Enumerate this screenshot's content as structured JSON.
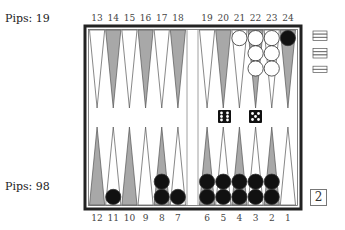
{
  "players": {
    "top": {
      "pips_label": "Pips:",
      "pips": "19",
      "color": "white"
    },
    "bottom": {
      "pips_label": "Pips:",
      "pips": "98",
      "color": "black"
    }
  },
  "point_labels_top": [
    "13",
    "14",
    "15",
    "16",
    "17",
    "18",
    "19",
    "20",
    "21",
    "22",
    "23",
    "24"
  ],
  "point_labels_bottom": [
    "12",
    "11",
    "10",
    "9",
    "8",
    "7",
    "6",
    "5",
    "4",
    "3",
    "2",
    "1"
  ],
  "checkers": {
    "21": {
      "color": "white",
      "count": 1
    },
    "22": {
      "color": "white",
      "count": 3
    },
    "23": {
      "color": "white",
      "count": 3
    },
    "24": {
      "color": "black",
      "count": 1
    },
    "11": {
      "color": "black",
      "count": 1
    },
    "8": {
      "color": "black",
      "count": 2
    },
    "7": {
      "color": "black",
      "count": 1
    },
    "6": {
      "color": "black",
      "count": 2
    },
    "5": {
      "color": "black",
      "count": 2
    },
    "4": {
      "color": "black",
      "count": 2
    },
    "3": {
      "color": "black",
      "count": 2
    },
    "2": {
      "color": "black",
      "count": 2
    }
  },
  "borne_off": {
    "white": [
      3,
      3,
      2
    ]
  },
  "dice": [
    6,
    5
  ],
  "cube": {
    "value": "2"
  },
  "colors": {
    "dark_point": "#a8a8a8",
    "light_point": "#ffffff",
    "frame": "#222222",
    "black_checker": "#111111",
    "white_checker": "#ffffff"
  }
}
